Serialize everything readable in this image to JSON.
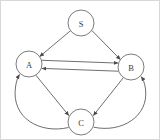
{
  "figure": {
    "width": 160,
    "height": 140,
    "background_color": "#ffffff",
    "border_color": "#d8d8d8",
    "node_stroke_color": "#5a5a5a",
    "edge_stroke_color": "#4a4a4a",
    "label_color": "#3a3a3a"
  },
  "graph": {
    "type": "directed",
    "nodes": [
      {
        "id": "S",
        "label": "S",
        "cx": 80,
        "cy": 22,
        "r": 13
      },
      {
        "id": "A",
        "label": "A",
        "cx": 28,
        "cy": 63,
        "r": 13
      },
      {
        "id": "B",
        "label": "B",
        "cx": 130,
        "cy": 66,
        "r": 13
      },
      {
        "id": "C",
        "label": "C",
        "cx": 80,
        "cy": 121,
        "r": 13
      }
    ],
    "edges": [
      {
        "id": "S-A",
        "from": "S",
        "to": "A",
        "shape": "straight",
        "path": "M 69.5 29.7 L 38.6 55.6",
        "arrow": true
      },
      {
        "id": "S-B",
        "from": "S",
        "to": "B",
        "shape": "straight",
        "path": "M 90.7 29.3 L 119.5 58.7",
        "arrow": true
      },
      {
        "id": "A-B",
        "from": "A",
        "to": "B",
        "shape": "straight",
        "path": "M 40.9 59.3 L 117.1 62.1",
        "arrow": true
      },
      {
        "id": "B-A",
        "from": "B",
        "to": "A",
        "shape": "straight",
        "path": "M 117.1 70.2 L 40.9 67.4",
        "arrow": true
      },
      {
        "id": "A-C",
        "from": "A",
        "to": "C",
        "shape": "straight",
        "path": "M 34.8 74.1 L 67.9 114.7",
        "arrow": true
      },
      {
        "id": "B-C",
        "from": "B",
        "to": "C",
        "shape": "straight",
        "path": "M 122.4 76.6 L 92.3 114.6",
        "arrow": true
      },
      {
        "id": "C-A",
        "from": "C",
        "to": "A",
        "shape": "curved",
        "path": "M 67.5 126.5 C 40 133 10 118 14.5 86 C 15.3 80.5 16.6 76.6 18.6 73.4",
        "arrow": true
      },
      {
        "id": "C-B",
        "from": "C",
        "to": "B",
        "shape": "curved",
        "path": "M 92.8 126.2 C 120 132 148 116 144.5 88 C 143.8 82.5 142.3 78.6 140.2 75.6",
        "arrow": true
      }
    ]
  }
}
